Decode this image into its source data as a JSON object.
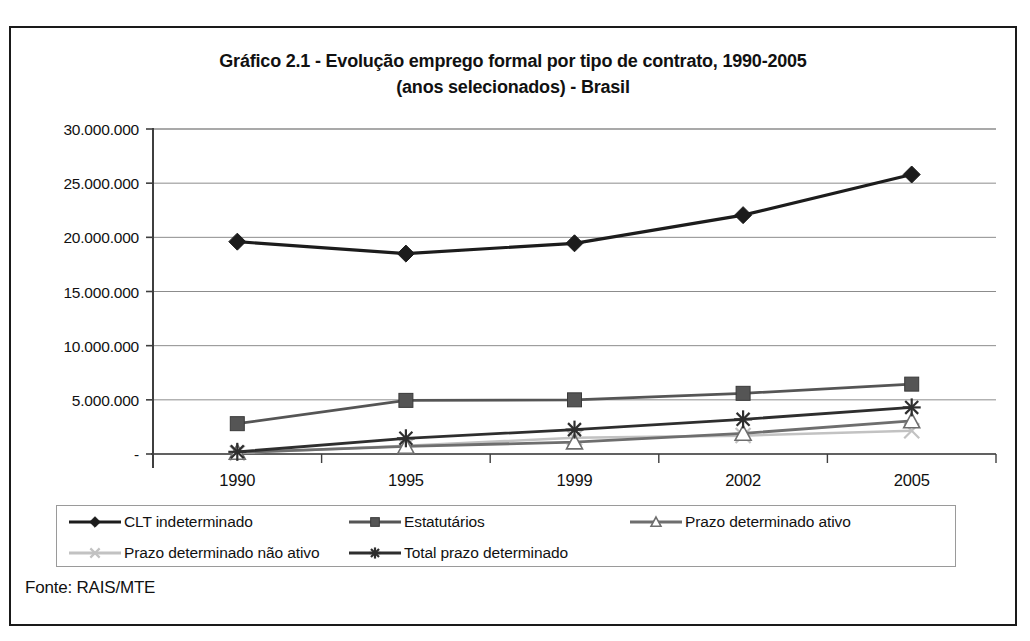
{
  "figure": {
    "title_line1": "Gráfico 2.1 - Evolução emprego formal por tipo de contrato, 1990-2005",
    "title_line2": "(anos selecionados) - Brasil",
    "source_note": "Fonte: RAIS/MTE"
  },
  "chart_data": {
    "type": "line",
    "title": "Gráfico 2.1 - Evolução emprego formal por tipo de contrato, 1990-2005 (anos selecionados) - Brasil",
    "subtitle": "(anos selecionados) - Brasil",
    "xlabel": "",
    "ylabel": "",
    "categories": [
      "1990",
      "1995",
      "1999",
      "2002",
      "2005"
    ],
    "x_tick_labels": [
      "1990",
      "1995",
      "1999",
      "2002",
      "2005"
    ],
    "y_tick_labels": [
      "-",
      "5.000.000",
      "10.000.000",
      "15.000.000",
      "20.000.000",
      "25.000.000",
      "30.000.000"
    ],
    "y_tick_values": [
      0,
      5000000,
      10000000,
      15000000,
      20000000,
      25000000,
      30000000
    ],
    "ylim": [
      0,
      30000000
    ],
    "grid": "horizontal",
    "legend_position": "bottom",
    "series": [
      {
        "name": "CLT indeterminado",
        "marker": "diamond",
        "color": "#1c1c1c",
        "values": [
          19600000,
          18500000,
          19450000,
          22050000,
          25800000
        ]
      },
      {
        "name": "Estatutários",
        "marker": "square",
        "color": "#555555",
        "values": [
          2800000,
          4950000,
          5000000,
          5600000,
          6450000
        ]
      },
      {
        "name": "Prazo determinado ativo",
        "marker": "triangle",
        "color": "#6e6e6e",
        "values": [
          150000,
          700000,
          1100000,
          1900000,
          3050000
        ]
      },
      {
        "name": "Prazo determinado não ativo",
        "marker": "x",
        "color": "#c2c2c2",
        "values": [
          100000,
          750000,
          1500000,
          1700000,
          2150000
        ]
      },
      {
        "name": "Total prazo determinado",
        "marker": "asterisk",
        "color": "#2e2e2e",
        "values": [
          200000,
          1450000,
          2250000,
          3200000,
          4300000
        ]
      }
    ]
  },
  "legend": {
    "items": [
      {
        "label": "CLT indeterminado",
        "marker": "diamond",
        "color": "#1c1c1c"
      },
      {
        "label": "Estatutários",
        "marker": "square",
        "color": "#555555"
      },
      {
        "label": "Prazo determinado ativo",
        "marker": "triangle",
        "color": "#6e6e6e"
      },
      {
        "label": "Prazo determinado não ativo",
        "marker": "x",
        "color": "#c2c2c2"
      },
      {
        "label": "Total prazo determinado",
        "marker": "asterisk",
        "color": "#2e2e2e"
      }
    ]
  },
  "colors": {
    "frame": "#1a1a1a",
    "axis": "#555555",
    "grid": "#8c8c8c",
    "text": "#111111"
  }
}
